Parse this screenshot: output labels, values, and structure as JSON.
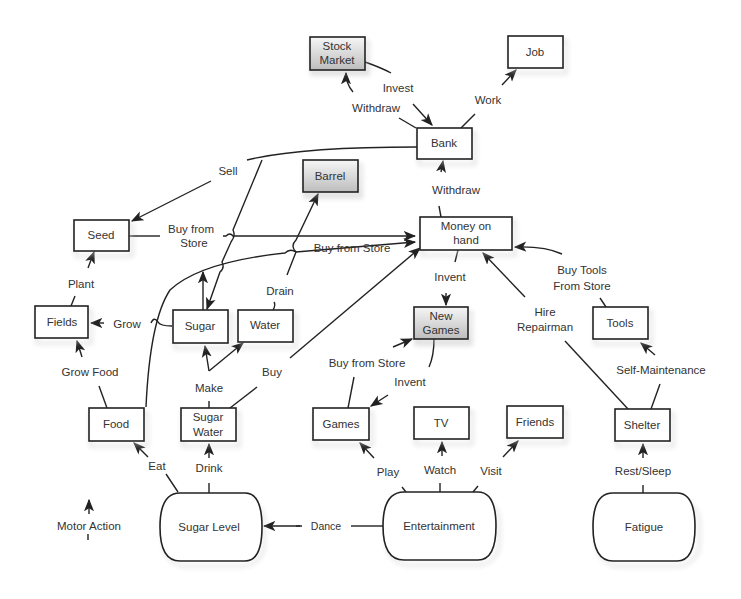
{
  "diagram": {
    "type": "concept-map / action-state diagram",
    "nodes": {
      "stock_market": {
        "label_line1": "Stock",
        "label_line2": "Market",
        "shaded": true
      },
      "job": {
        "label": "Job",
        "shaded": false
      },
      "bank": {
        "label": "Bank",
        "shaded": false
      },
      "barrel": {
        "label": "Barrel",
        "shaded": true
      },
      "seed": {
        "label": "Seed",
        "shaded": false
      },
      "money_on_hand": {
        "label_line1": "Money on",
        "label_line2": "hand",
        "shaded": false
      },
      "fields": {
        "label": "Fields",
        "shaded": false
      },
      "sugar": {
        "label": "Sugar",
        "shaded": false
      },
      "water": {
        "label": "Water",
        "shaded": false
      },
      "new_games": {
        "label_line1": "New",
        "label_line2": "Games",
        "shaded": true
      },
      "tools": {
        "label": "Tools",
        "shaded": false
      },
      "food": {
        "label": "Food",
        "shaded": false
      },
      "sugar_water": {
        "label_line1": "Sugar",
        "label_line2": "Water",
        "shaded": false
      },
      "games": {
        "label": "Games",
        "shaded": false
      },
      "tv": {
        "label": "TV",
        "shaded": false
      },
      "friends": {
        "label": "Friends",
        "shaded": false
      },
      "shelter": {
        "label": "Shelter",
        "shaded": false
      },
      "sugar_level": {
        "label": "Sugar Level",
        "shape": "terminal"
      },
      "entertainment": {
        "label": "Entertainment",
        "shape": "terminal"
      },
      "fatigue": {
        "label": "Fatigue",
        "shape": "terminal"
      }
    },
    "edge_labels": {
      "invest": "Invest",
      "withdraw_stock": "Withdraw",
      "work": "Work",
      "sell": "Sell",
      "withdraw_bank": "Withdraw",
      "buy_from_store_seed_l1": "Buy from",
      "buy_from_store_seed_l2": "Store",
      "buy_from_store_mid": "Buy from Store",
      "plant": "Plant",
      "drain": "Drain",
      "grow": "Grow",
      "invent_top": "Invent",
      "buy_tools_l1": "Buy Tools",
      "buy_tools_l2": "From Store",
      "hire_l1": "Hire",
      "hire_l2": "Repairman",
      "grow_food": "Grow Food",
      "make": "Make",
      "buy": "Buy",
      "buy_from_store_games": "Buy from Store",
      "invent_games": "Invent",
      "self_maintenance": "Self-Maintenance",
      "eat": "Eat",
      "drink": "Drink",
      "play": "Play",
      "watch": "Watch",
      "visit": "Visit",
      "rest_sleep": "Rest/Sleep",
      "dance": "Dance"
    },
    "legend": {
      "motor_action": "Motor Action"
    },
    "colors": {
      "stroke": "#222222",
      "text": "#333333",
      "shaded_fill_top": "#f4f4f4",
      "shaded_fill_bottom": "#bdbdbd",
      "background": "#ffffff"
    }
  }
}
